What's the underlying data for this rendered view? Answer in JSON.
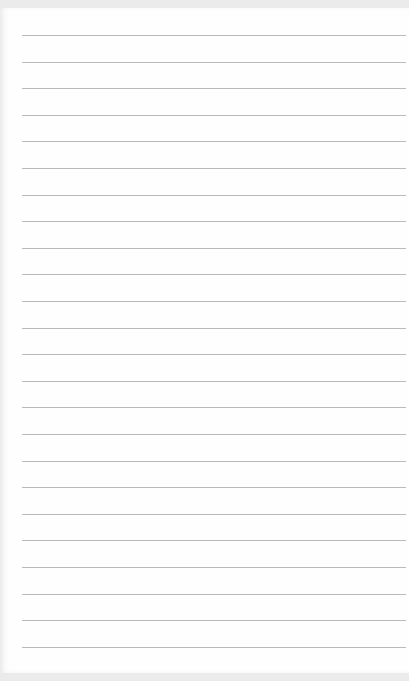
{
  "page": {
    "type": "lined-notepad-page",
    "line_count": 24,
    "first_line_y": 35,
    "line_spacing": 26.6,
    "line_color": "#b9b9b9",
    "paper_color": "#fefefe",
    "background_color": "#ebebeb"
  }
}
